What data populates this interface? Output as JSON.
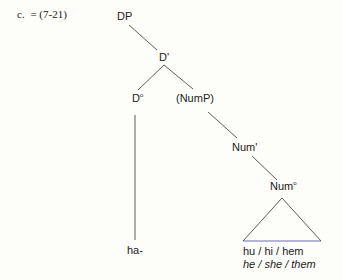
{
  "example": {
    "label": "c.",
    "ref": "= (7-21)"
  },
  "tree": {
    "nodes": {
      "dp": "DP",
      "d_bar": "D'",
      "d_head": "D",
      "d_head_sup": "o",
      "nump": "(NumP)",
      "num_bar": "Num'",
      "num_head": "Num",
      "num_head_sup": "o"
    },
    "leaves": {
      "d_leaf": "ha-",
      "num_leaf": "hu / hi / hem",
      "num_gloss": "he / she / them"
    },
    "line_color": "#333333",
    "triangle_base_color": "#4a4aa0"
  }
}
